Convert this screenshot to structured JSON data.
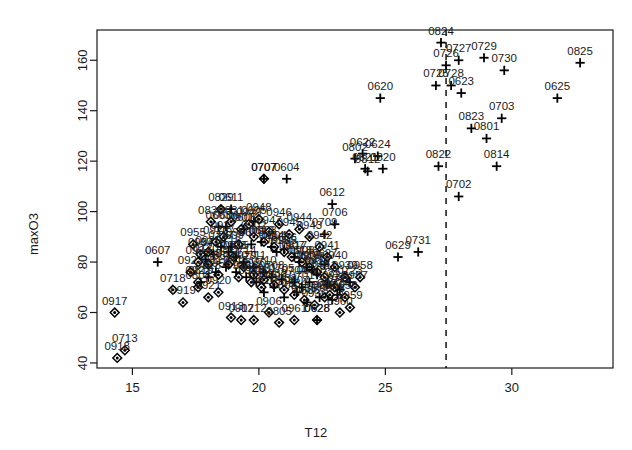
{
  "chart_data": {
    "type": "scatter",
    "title": "",
    "xlabel": "T12",
    "ylabel": "maxO3",
    "xlim": [
      13.6,
      34.0
    ],
    "ylim": [
      38.0,
      172.0
    ],
    "xticks": [
      15,
      20,
      25,
      30
    ],
    "yticks": [
      40,
      60,
      80,
      100,
      120,
      140,
      160
    ],
    "grid": false,
    "legend": null,
    "annotations": [
      {
        "type": "vertical-dashed-line",
        "x": 27.4,
        "style": "dashed",
        "color": "#000000"
      }
    ],
    "marker_types": {
      "plus": "plus-marker",
      "diamond": "filled-diamond-marker"
    },
    "point_label_note": "Each point is labelled with a 4-digit MMDD date code placed above the marker.",
    "series": [
      {
        "name": "plus",
        "marker": "plus",
        "points": [
          {
            "label": "0604",
            "x": 21.1,
            "y": 113.0
          },
          {
            "label": "0612",
            "x": 22.9,
            "y": 103.0
          },
          {
            "label": "0620",
            "x": 24.8,
            "y": 145.0
          },
          {
            "label": "0622",
            "x": 24.1,
            "y": 123.0
          },
          {
            "label": "0623",
            "x": 28.0,
            "y": 147.0
          },
          {
            "label": "0624",
            "x": 24.7,
            "y": 122.0
          },
          {
            "label": "0625",
            "x": 31.8,
            "y": 145.0
          },
          {
            "label": "0629",
            "x": 25.5,
            "y": 82.0
          },
          {
            "label": "0702",
            "x": 27.9,
            "y": 106.0
          },
          {
            "label": "0703",
            "x": 29.6,
            "y": 137.0
          },
          {
            "label": "0706",
            "x": 23.0,
            "y": 95.0
          },
          {
            "label": "0707",
            "x": 20.2,
            "y": 113.0
          },
          {
            "label": "0709",
            "x": 22.6,
            "y": 91.0
          },
          {
            "label": "0725",
            "x": 27.0,
            "y": 150.0
          },
          {
            "label": "0726",
            "x": 27.4,
            "y": 158.0
          },
          {
            "label": "0727",
            "x": 27.9,
            "y": 160.0
          },
          {
            "label": "0728",
            "x": 27.6,
            "y": 150.0
          },
          {
            "label": "0729",
            "x": 28.9,
            "y": 161.0
          },
          {
            "label": "0730",
            "x": 29.7,
            "y": 156.0
          },
          {
            "label": "0731",
            "x": 26.3,
            "y": 84.0
          },
          {
            "label": "0801",
            "x": 29.0,
            "y": 129.0
          },
          {
            "label": "0802",
            "x": 23.8,
            "y": 121.0
          },
          {
            "label": "0812",
            "x": 24.3,
            "y": 116.0
          },
          {
            "label": "0814",
            "x": 29.4,
            "y": 118.0
          },
          {
            "label": "0820",
            "x": 24.9,
            "y": 117.0
          },
          {
            "label": "0821",
            "x": 24.2,
            "y": 117.0
          },
          {
            "label": "0822",
            "x": 27.1,
            "y": 118.0
          },
          {
            "label": "0823",
            "x": 28.4,
            "y": 133.0
          },
          {
            "label": "0824",
            "x": 27.2,
            "y": 167.0
          },
          {
            "label": "0825",
            "x": 32.7,
            "y": 159.0
          },
          {
            "label": "0607",
            "x": 16.0,
            "y": 80.0
          },
          {
            "label": "0605",
            "x": 19.8,
            "y": 96.0
          },
          {
            "label": "0611",
            "x": 18.9,
            "y": 101.0
          },
          {
            "label": "0606",
            "x": 18.7,
            "y": 94.0
          },
          {
            "label": "0603",
            "x": 18.4,
            "y": 94.0
          },
          {
            "label": "0608",
            "x": 19.4,
            "y": 93.0
          },
          {
            "label": "0609",
            "x": 18.9,
            "y": 86.0
          },
          {
            "label": "0610",
            "x": 19.7,
            "y": 87.0
          },
          {
            "label": "0613",
            "x": 20.1,
            "y": 88.0
          },
          {
            "label": "0614",
            "x": 20.5,
            "y": 86.0
          },
          {
            "label": "0615",
            "x": 20.7,
            "y": 84.0
          },
          {
            "label": "0616",
            "x": 21.0,
            "y": 85.0
          },
          {
            "label": "0617",
            "x": 21.4,
            "y": 82.0
          },
          {
            "label": "0618",
            "x": 21.6,
            "y": 80.0
          },
          {
            "label": "0619",
            "x": 21.9,
            "y": 78.0
          },
          {
            "label": "0621",
            "x": 22.1,
            "y": 77.0
          },
          {
            "label": "0626",
            "x": 22.3,
            "y": 75.0
          },
          {
            "label": "0627",
            "x": 22.6,
            "y": 79.0
          },
          {
            "label": "0628",
            "x": 22.3,
            "y": 57.0
          },
          {
            "label": "0630",
            "x": 22.0,
            "y": 72.0
          },
          {
            "label": "0701",
            "x": 21.7,
            "y": 70.0
          },
          {
            "label": "0704",
            "x": 21.4,
            "y": 72.0
          },
          {
            "label": "0705",
            "x": 20.9,
            "y": 73.0
          },
          {
            "label": "0708",
            "x": 20.5,
            "y": 74.0
          },
          {
            "label": "0710",
            "x": 20.2,
            "y": 76.0
          },
          {
            "label": "0711",
            "x": 19.8,
            "y": 78.0
          },
          {
            "label": "0714",
            "x": 19.4,
            "y": 80.0
          },
          {
            "label": "0715",
            "x": 19.1,
            "y": 82.0
          },
          {
            "label": "0716",
            "x": 18.8,
            "y": 84.0
          },
          {
            "label": "0717",
            "x": 18.5,
            "y": 86.0
          },
          {
            "label": "0719",
            "x": 18.2,
            "y": 83.0
          },
          {
            "label": "0720",
            "x": 17.9,
            "y": 81.0
          },
          {
            "label": "0721",
            "x": 22.7,
            "y": 71.0
          },
          {
            "label": "0722",
            "x": 23.2,
            "y": 69.0
          },
          {
            "label": "0723",
            "x": 23.6,
            "y": 72.0
          },
          {
            "label": "0724",
            "x": 23.1,
            "y": 67.0
          },
          {
            "label": "0803",
            "x": 22.9,
            "y": 65.0
          },
          {
            "label": "0804",
            "x": 22.4,
            "y": 66.0
          },
          {
            "label": "0806",
            "x": 21.9,
            "y": 64.0
          },
          {
            "label": "0807",
            "x": 21.5,
            "y": 68.0
          },
          {
            "label": "0808",
            "x": 21.0,
            "y": 66.0
          },
          {
            "label": "0809",
            "x": 20.6,
            "y": 70.0
          },
          {
            "label": "0810",
            "x": 20.2,
            "y": 68.0
          },
          {
            "label": "0811",
            "x": 19.9,
            "y": 72.0
          },
          {
            "label": "0813",
            "x": 19.5,
            "y": 74.0
          },
          {
            "label": "0815",
            "x": 19.1,
            "y": 76.0
          },
          {
            "label": "0816",
            "x": 18.7,
            "y": 78.0
          },
          {
            "label": "0817",
            "x": 18.3,
            "y": 76.0
          },
          {
            "label": "0818",
            "x": 18.0,
            "y": 74.0
          },
          {
            "label": "0819",
            "x": 17.7,
            "y": 72.0
          }
        ]
      },
      {
        "name": "diamond",
        "marker": "diamond",
        "points": [
          {
            "label": "0707d",
            "x": 20.2,
            "y": 113.0
          },
          {
            "label": "0829",
            "x": 18.5,
            "y": 101.0
          },
          {
            "label": "0830",
            "x": 18.1,
            "y": 96.0
          },
          {
            "label": "0831",
            "x": 18.9,
            "y": 96.0
          },
          {
            "label": "0901",
            "x": 19.3,
            "y": 93.0
          },
          {
            "label": "0902",
            "x": 19.8,
            "y": 90.0
          },
          {
            "label": "0903",
            "x": 20.2,
            "y": 88.0
          },
          {
            "label": "0904",
            "x": 20.6,
            "y": 86.0
          },
          {
            "label": "0905",
            "x": 21.0,
            "y": 84.0
          },
          {
            "label": "0906",
            "x": 20.4,
            "y": 60.0
          },
          {
            "label": "0907",
            "x": 21.3,
            "y": 82.0
          },
          {
            "label": "0908",
            "x": 21.7,
            "y": 80.0
          },
          {
            "label": "0909",
            "x": 22.0,
            "y": 78.0
          },
          {
            "label": "0910",
            "x": 22.3,
            "y": 76.0
          },
          {
            "label": "0911",
            "x": 22.6,
            "y": 74.0
          },
          {
            "label": "0912",
            "x": 19.3,
            "y": 57.0
          },
          {
            "label": "0913",
            "x": 18.9,
            "y": 58.0
          },
          {
            "label": "0914",
            "x": 20.1,
            "y": 70.0
          },
          {
            "label": "0915",
            "x": 19.7,
            "y": 72.0
          },
          {
            "label": "0916",
            "x": 19.2,
            "y": 74.0
          },
          {
            "label": "0917",
            "x": 14.3,
            "y": 60.0
          },
          {
            "label": "0918",
            "x": 14.4,
            "y": 42.0
          },
          {
            "label": "0919",
            "x": 17.0,
            "y": 64.0
          },
          {
            "label": "0713",
            "x": 14.7,
            "y": 45.0
          },
          {
            "label": "0712",
            "x": 19.8,
            "y": 57.0
          },
          {
            "label": "0718",
            "x": 16.6,
            "y": 69.0
          },
          {
            "label": "0805",
            "x": 20.8,
            "y": 56.0
          },
          {
            "label": "0808d",
            "x": 17.6,
            "y": 70.0
          },
          {
            "label": "0628d",
            "x": 22.3,
            "y": 57.0
          },
          {
            "label": "0920",
            "x": 18.4,
            "y": 68.0
          },
          {
            "label": "0921",
            "x": 18.0,
            "y": 66.0
          },
          {
            "label": "0922",
            "x": 17.6,
            "y": 72.0
          },
          {
            "label": "0923",
            "x": 17.3,
            "y": 76.0
          },
          {
            "label": "0924",
            "x": 17.6,
            "y": 80.0
          },
          {
            "label": "0925",
            "x": 18.0,
            "y": 84.0
          },
          {
            "label": "0926",
            "x": 18.3,
            "y": 88.0
          },
          {
            "label": "0927",
            "x": 18.6,
            "y": 90.0
          },
          {
            "label": "0928",
            "x": 19.0,
            "y": 82.0
          },
          {
            "label": "0929",
            "x": 19.4,
            "y": 78.0
          },
          {
            "label": "0930",
            "x": 19.8,
            "y": 75.0
          },
          {
            "label": "0931",
            "x": 20.2,
            "y": 73.0
          },
          {
            "label": "0932",
            "x": 20.6,
            "y": 71.0
          },
          {
            "label": "0933",
            "x": 21.0,
            "y": 69.0
          },
          {
            "label": "0934",
            "x": 21.4,
            "y": 67.0
          },
          {
            "label": "0935",
            "x": 21.8,
            "y": 65.0
          },
          {
            "label": "0936",
            "x": 22.2,
            "y": 63.0
          },
          {
            "label": "0937",
            "x": 22.6,
            "y": 66.0
          },
          {
            "label": "0938",
            "x": 23.0,
            "y": 70.0
          },
          {
            "label": "0939",
            "x": 23.4,
            "y": 74.0
          },
          {
            "label": "0940",
            "x": 23.0,
            "y": 78.0
          },
          {
            "label": "0941",
            "x": 22.7,
            "y": 82.0
          },
          {
            "label": "0942",
            "x": 22.4,
            "y": 86.0
          },
          {
            "label": "0943",
            "x": 22.0,
            "y": 90.0
          },
          {
            "label": "0944",
            "x": 21.6,
            "y": 93.0
          },
          {
            "label": "0945",
            "x": 21.2,
            "y": 91.0
          },
          {
            "label": "0946",
            "x": 20.8,
            "y": 95.0
          },
          {
            "label": "0947",
            "x": 20.4,
            "y": 92.0
          },
          {
            "label": "0948",
            "x": 20.0,
            "y": 97.0
          },
          {
            "label": "0949",
            "x": 19.6,
            "y": 95.0
          },
          {
            "label": "0950",
            "x": 19.2,
            "y": 87.0
          },
          {
            "label": "0951",
            "x": 18.8,
            "y": 79.0
          },
          {
            "label": "0952",
            "x": 18.4,
            "y": 75.0
          },
          {
            "label": "0953",
            "x": 18.0,
            "y": 79.0
          },
          {
            "label": "0954",
            "x": 17.7,
            "y": 83.0
          },
          {
            "label": "0955",
            "x": 17.4,
            "y": 87.0
          },
          {
            "label": "0956",
            "x": 23.4,
            "y": 66.0
          },
          {
            "label": "0957",
            "x": 23.8,
            "y": 70.0
          },
          {
            "label": "0958",
            "x": 24.0,
            "y": 74.0
          },
          {
            "label": "0959",
            "x": 23.6,
            "y": 62.0
          },
          {
            "label": "0960",
            "x": 23.2,
            "y": 60.0
          },
          {
            "label": "0961",
            "x": 21.4,
            "y": 57.0
          },
          {
            "label": "0962",
            "x": 22.8,
            "y": 67.0
          }
        ]
      }
    ]
  },
  "axes": {
    "xlabel": "T12",
    "ylabel": "maxO3",
    "xticklabels": [
      "15",
      "20",
      "25",
      "30"
    ],
    "yticklabels": [
      "40",
      "60",
      "80",
      "100",
      "120",
      "140",
      "160"
    ]
  },
  "colors": {
    "foreground": "#1a1a1a",
    "background": "#ffffff",
    "marker": "#000000",
    "dashed_line": "#000000"
  }
}
